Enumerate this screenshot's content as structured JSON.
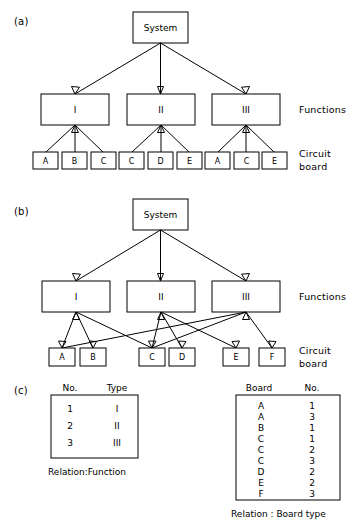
{
  "figure": {
    "panels": [
      {
        "id": "a",
        "label": "(a)",
        "root": {
          "label": "System"
        },
        "functions": [
          {
            "label": "I"
          },
          {
            "label": "II"
          },
          {
            "label": "III"
          }
        ],
        "boards": [
          {
            "label": "A"
          },
          {
            "label": "B"
          },
          {
            "label": "C"
          },
          {
            "label": "C"
          },
          {
            "label": "D"
          },
          {
            "label": "E"
          },
          {
            "label": "A"
          },
          {
            "label": "C"
          },
          {
            "label": "E"
          }
        ],
        "row_labels": {
          "functions": "Functions",
          "circuit_board_line1": "Circuit",
          "circuit_board_line2": "board"
        }
      },
      {
        "id": "b",
        "label": "(b)",
        "root": {
          "label": "System"
        },
        "functions": [
          {
            "label": "I"
          },
          {
            "label": "II"
          },
          {
            "label": "III"
          }
        ],
        "boards": [
          {
            "label": "A"
          },
          {
            "label": "B"
          },
          {
            "label": "C"
          },
          {
            "label": "D"
          },
          {
            "label": "E"
          },
          {
            "label": "F"
          }
        ],
        "row_labels": {
          "functions": "Functions",
          "circuit_board_line1": "Circuit",
          "circuit_board_line2": "board"
        }
      },
      {
        "id": "c",
        "label": "(c)",
        "tables": [
          {
            "name": "function-relation-table",
            "headers": [
              "No.",
              "Type"
            ],
            "rows": [
              [
                "1",
                "I"
              ],
              [
                "2",
                "II"
              ],
              [
                "3",
                "III"
              ]
            ],
            "caption": "Relation:Function"
          },
          {
            "name": "board-type-relation-table",
            "headers": [
              "Board",
              "No."
            ],
            "rows": [
              [
                "A",
                "1"
              ],
              [
                "A",
                "3"
              ],
              [
                "B",
                "1"
              ],
              [
                "C",
                "1"
              ],
              [
                "C",
                "2"
              ],
              [
                "C",
                "3"
              ],
              [
                "D",
                "2"
              ],
              [
                "E",
                "2"
              ],
              [
                "F",
                "3"
              ]
            ],
            "caption": "Relation : Board type"
          }
        ]
      }
    ],
    "colors": {
      "stroke": "#000000",
      "fill": "#ffffff",
      "background": "#ffffff"
    }
  },
  "diagram_data": {
    "type": "tree-diagram",
    "panel_a": {
      "description": "Hierarchical tree: System decomposes into Functions I, II, III; each function has its own dedicated circuit boards (duplicated board letters).",
      "edges_system_to_functions": [
        [
          "System",
          "I"
        ],
        [
          "System",
          "II"
        ],
        [
          "System",
          "III"
        ]
      ],
      "edges_function_to_boards": [
        [
          "I",
          "A"
        ],
        [
          "I",
          "B"
        ],
        [
          "I",
          "C"
        ],
        [
          "II",
          "C"
        ],
        [
          "II",
          "D"
        ],
        [
          "II",
          "E"
        ],
        [
          "III",
          "A"
        ],
        [
          "III",
          "C"
        ],
        [
          "III",
          "E"
        ]
      ]
    },
    "panel_b": {
      "description": "Network diagram: System decomposes into Functions I, II, III; circuit boards A-F are shared between functions, producing crossing links.",
      "edges_system_to_functions": [
        [
          "System",
          "I"
        ],
        [
          "System",
          "II"
        ],
        [
          "System",
          "III"
        ]
      ],
      "edges_function_to_boards": [
        [
          "I",
          "A"
        ],
        [
          "I",
          "B"
        ],
        [
          "I",
          "C"
        ],
        [
          "II",
          "C"
        ],
        [
          "II",
          "D"
        ],
        [
          "II",
          "E"
        ],
        [
          "III",
          "A"
        ],
        [
          "III",
          "C"
        ],
        [
          "III",
          "F"
        ]
      ]
    }
  }
}
